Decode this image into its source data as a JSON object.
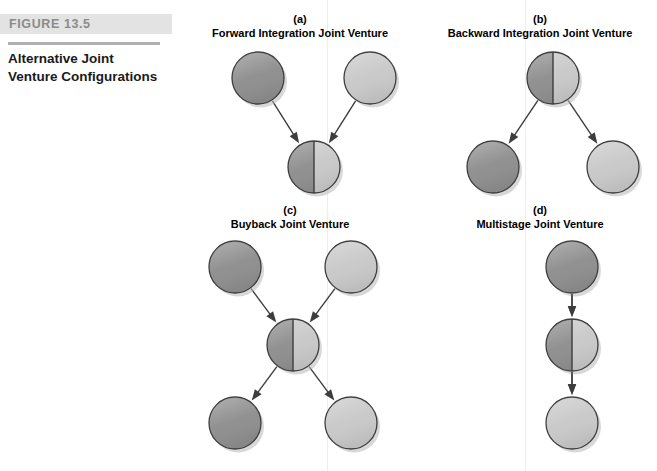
{
  "figure": {
    "number_label": "FIGURE 13.5",
    "caption_line_1": "Alternative Joint",
    "caption_line_2": "Venture Configurations"
  },
  "colors": {
    "dark_gray": "#8f8f8f",
    "light_gray": "#c9c9c9",
    "outline": "#3d3d3d",
    "arrow": "#3d3d3d",
    "shadow": "#b8b8b8",
    "rule": "#b0b0b0",
    "figure_bar_bg": "#e3e3e3",
    "figure_label_text": "#8a8a8a"
  },
  "panels": [
    {
      "id": "a",
      "letter": "(a)",
      "title": "Forward Integration Joint Venture",
      "layout": "v-converging",
      "nodes": [
        {
          "name": "parent-left",
          "fill": "dark",
          "cx": 64,
          "cy": 36,
          "r": 26
        },
        {
          "name": "parent-right",
          "fill": "light",
          "cx": 176,
          "cy": 36,
          "r": 26
        },
        {
          "name": "joint-venture",
          "fill": "split",
          "cx": 120,
          "cy": 125,
          "r": 26
        }
      ],
      "arrows": [
        {
          "from": "parent-left",
          "to": "joint-venture"
        },
        {
          "from": "parent-right",
          "to": "joint-venture"
        }
      ]
    },
    {
      "id": "b",
      "letter": "(b)",
      "title": "Backward Integration Joint Venture",
      "layout": "v-diverging",
      "nodes": [
        {
          "name": "joint-venture",
          "fill": "split",
          "cx": 122,
          "cy": 36,
          "r": 26
        },
        {
          "name": "child-left",
          "fill": "dark",
          "cx": 62,
          "cy": 125,
          "r": 26
        },
        {
          "name": "child-right",
          "fill": "light",
          "cx": 182,
          "cy": 125,
          "r": 26
        }
      ],
      "arrows": [
        {
          "from": "joint-venture",
          "to": "child-left"
        },
        {
          "from": "joint-venture",
          "to": "child-right"
        }
      ]
    },
    {
      "id": "c",
      "letter": "(c)",
      "title": "Buyback Joint Venture",
      "layout": "x-cross",
      "nodes": [
        {
          "name": "parent-left",
          "fill": "dark",
          "cx": 42,
          "cy": 34,
          "r": 26
        },
        {
          "name": "parent-right",
          "fill": "light",
          "cx": 158,
          "cy": 34,
          "r": 26
        },
        {
          "name": "joint-venture",
          "fill": "split",
          "cx": 100,
          "cy": 112,
          "r": 26
        },
        {
          "name": "child-left",
          "fill": "dark",
          "cx": 42,
          "cy": 190,
          "r": 26
        },
        {
          "name": "child-right",
          "fill": "light",
          "cx": 158,
          "cy": 190,
          "r": 26
        }
      ],
      "arrows": [
        {
          "from": "parent-left",
          "to": "joint-venture"
        },
        {
          "from": "parent-right",
          "to": "joint-venture"
        },
        {
          "from": "joint-venture",
          "to": "child-left"
        },
        {
          "from": "joint-venture",
          "to": "child-right"
        }
      ]
    },
    {
      "id": "d",
      "letter": "(d)",
      "title": "Multistage Joint Venture",
      "layout": "vertical-chain",
      "nodes": [
        {
          "name": "stage-one",
          "fill": "dark",
          "cx": 100,
          "cy": 34,
          "r": 26
        },
        {
          "name": "joint-venture",
          "fill": "split",
          "cx": 100,
          "cy": 112,
          "r": 26
        },
        {
          "name": "stage-three",
          "fill": "light",
          "cx": 100,
          "cy": 190,
          "r": 26
        }
      ],
      "arrows": [
        {
          "from": "stage-one",
          "to": "joint-venture"
        },
        {
          "from": "joint-venture",
          "to": "stage-three"
        }
      ]
    }
  ]
}
